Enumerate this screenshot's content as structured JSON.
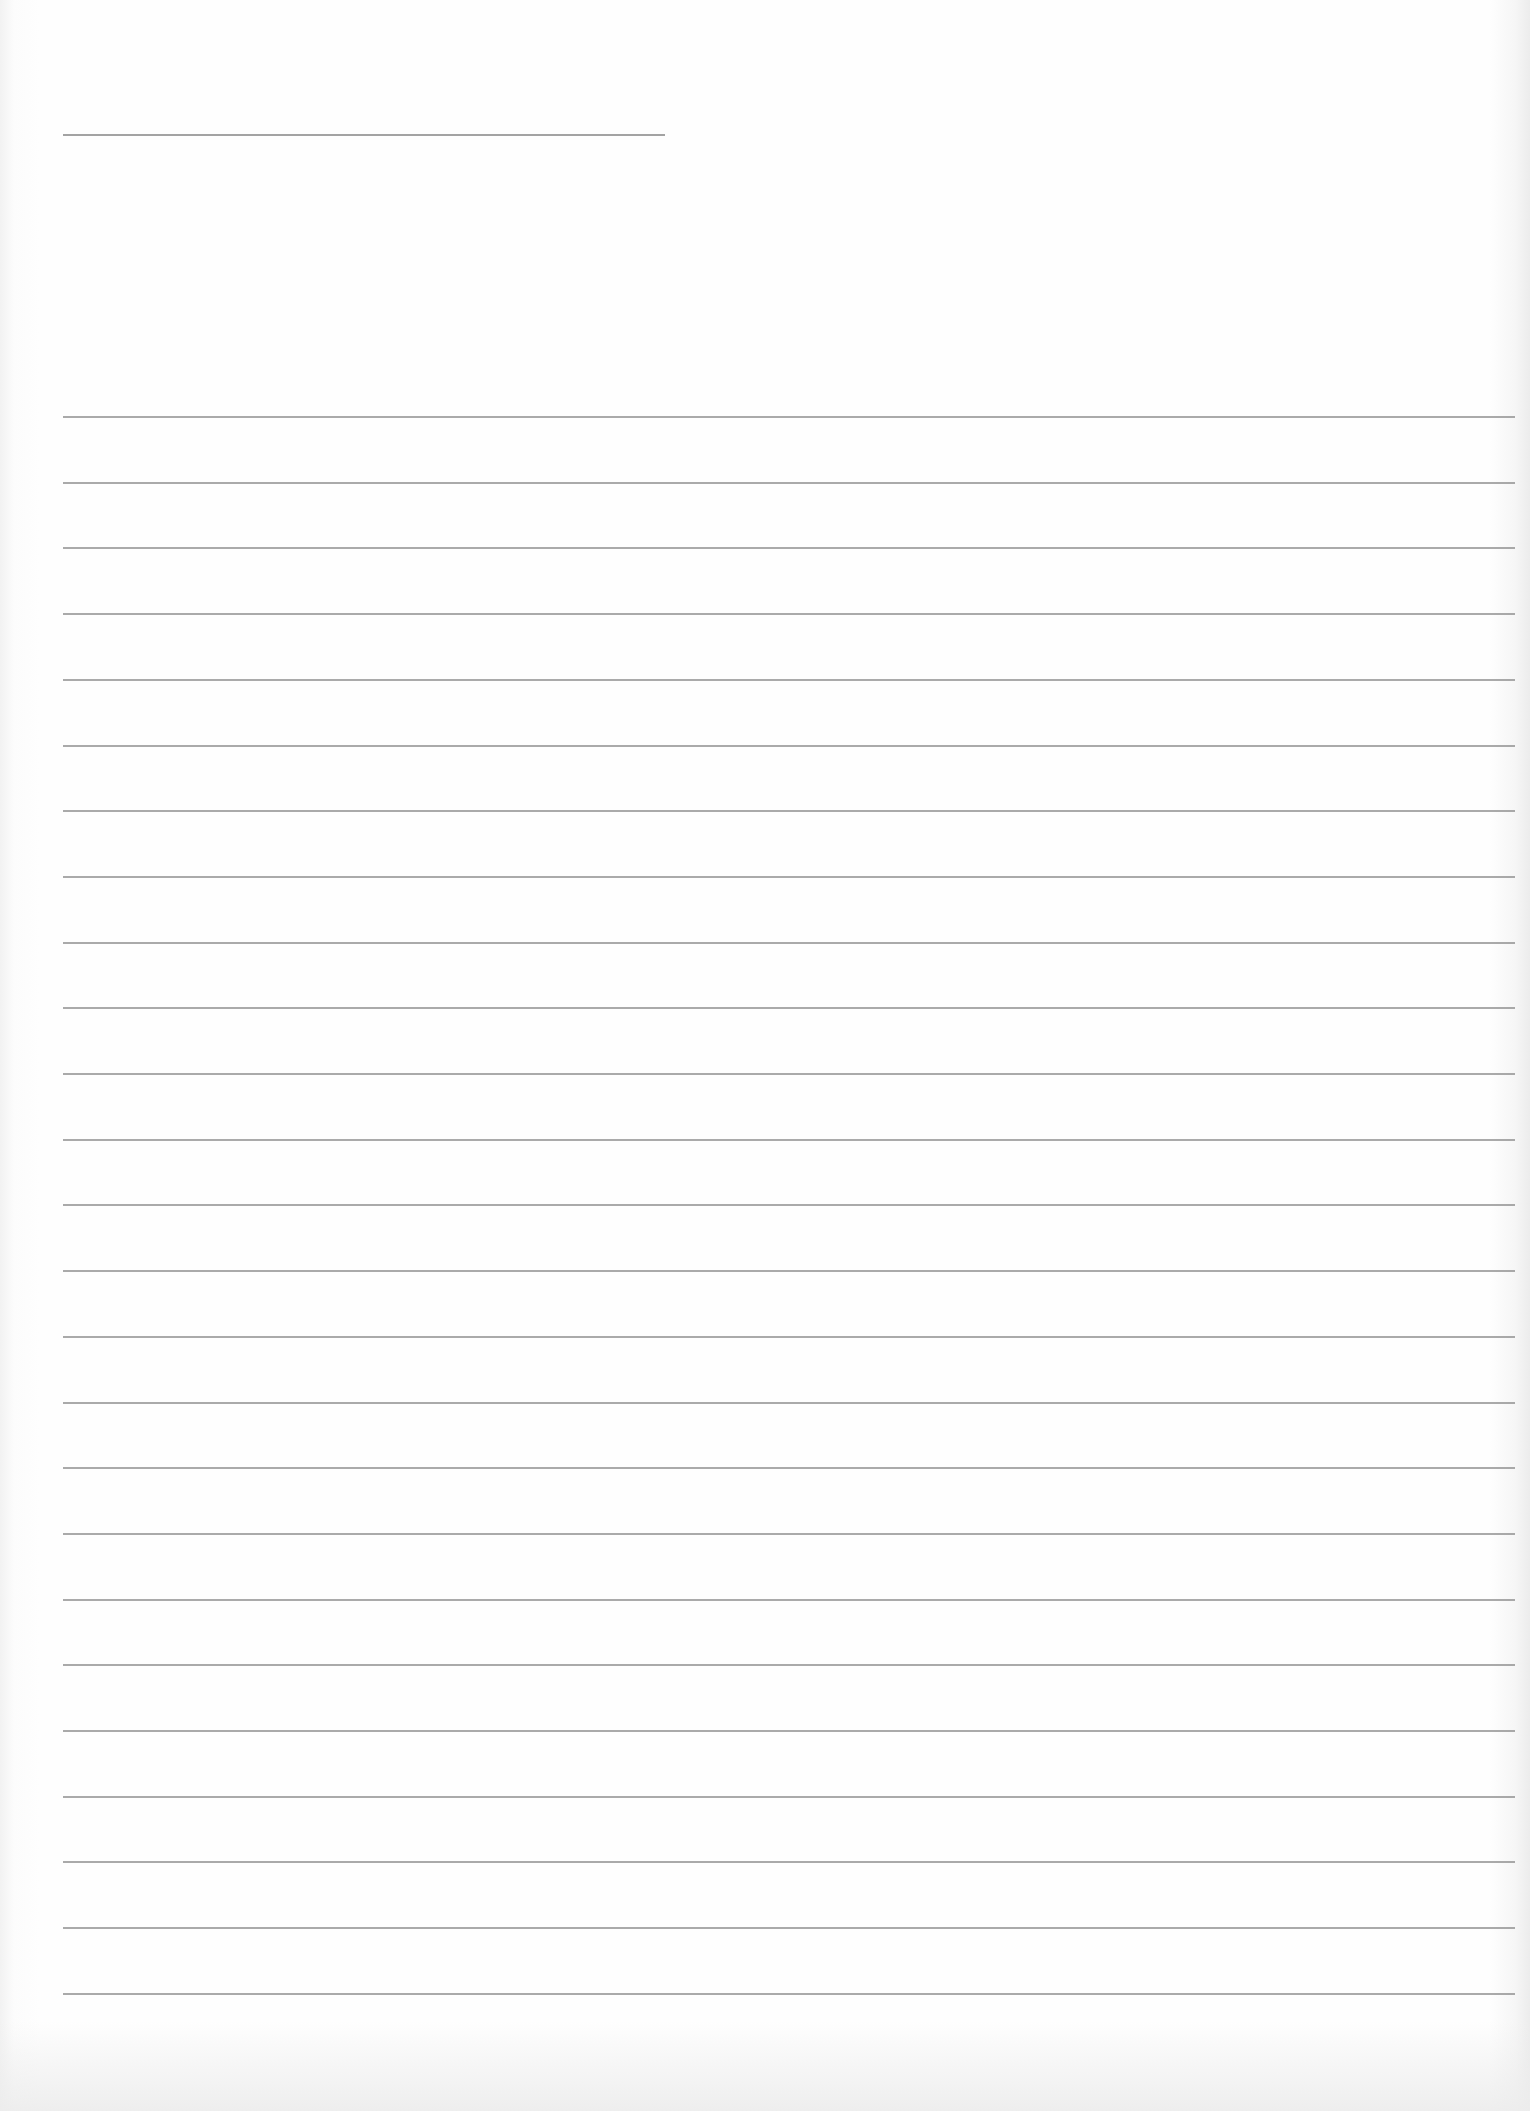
{
  "document": {
    "type": "lined-sheet",
    "title_line": {
      "left": 63,
      "top": 134,
      "width": 602
    },
    "rule_lines": {
      "count": 25,
      "left": 63,
      "right_edge": 1515,
      "first_top": 416,
      "spacing": 65.7
    },
    "colors": {
      "paper": "#fdfdfd",
      "line": "#8e8e8e"
    }
  }
}
